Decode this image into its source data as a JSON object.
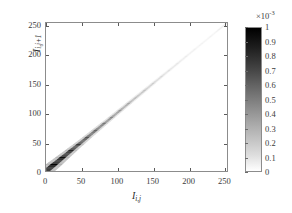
{
  "figure": {
    "background_color": "#ffffff",
    "axis_color": "#8c8c8c",
    "text_color": "#3b3b3b"
  },
  "axes": {
    "xlabel_base": "I",
    "xlabel_sub": "i,j",
    "ylabel_base": "I",
    "ylabel_sub": "i,j+1",
    "xticklabels": [
      "0",
      "50",
      "100",
      "150",
      "200",
      "250"
    ],
    "yticklabels": [
      "0",
      "50",
      "100",
      "150",
      "200",
      "250"
    ]
  },
  "colorbar": {
    "exponent_mantissa": "×10",
    "exponent_power": "-3",
    "ticklabels": [
      "0",
      "0.1",
      "0.2",
      "0.3",
      "0.4",
      "0.5",
      "0.6",
      "0.7",
      "0.8",
      "0.9",
      "1"
    ],
    "colormap": "grayscale-inverted",
    "high_color": "#000000",
    "low_color": "#ffffff"
  },
  "chart_data": {
    "type": "heatmap",
    "title": "",
    "xlabel": "I_{i,j}",
    "ylabel": "I_{i,j+1}",
    "xlim": [
      0,
      255
    ],
    "ylim": [
      0,
      255
    ],
    "xticks": [
      0,
      50,
      100,
      150,
      200,
      250
    ],
    "yticks": [
      0,
      50,
      100,
      150,
      200,
      250
    ],
    "grid": false,
    "colorbar": {
      "label": "",
      "scale_multiplier": 0.001,
      "ticks": [
        0,
        0.1,
        0.2,
        0.3,
        0.4,
        0.5,
        0.6,
        0.7,
        0.8,
        0.9,
        1.0
      ],
      "clim": [
        0,
        0.001
      ],
      "position": "right",
      "colormap": "gray reversed"
    },
    "diagonal_profile": {
      "x": [
        0,
        10,
        20,
        30,
        40,
        50,
        60,
        70,
        80,
        90,
        100,
        110,
        120,
        130,
        140,
        150,
        160,
        170,
        180,
        190,
        200,
        210,
        220,
        230,
        240,
        250,
        255
      ],
      "intensity": [
        1.0,
        1.0,
        0.96,
        0.9,
        0.82,
        0.74,
        0.66,
        0.6,
        0.54,
        0.48,
        0.43,
        0.38,
        0.33,
        0.28,
        0.24,
        0.2,
        0.16,
        0.13,
        0.11,
        0.09,
        0.07,
        0.06,
        0.05,
        0.05,
        0.06,
        0.1,
        0.12
      ],
      "half_width": [
        5.5,
        5.2,
        4.6,
        4.1,
        3.6,
        3.2,
        2.9,
        2.7,
        2.5,
        2.3,
        2.2,
        2.1,
        2.0,
        1.9,
        1.8,
        1.7,
        1.6,
        1.5,
        1.45,
        1.4,
        1.35,
        1.3,
        1.25,
        1.2,
        1.15,
        1.1,
        1.1
      ]
    },
    "off_diagonal_value": 0.0
  }
}
